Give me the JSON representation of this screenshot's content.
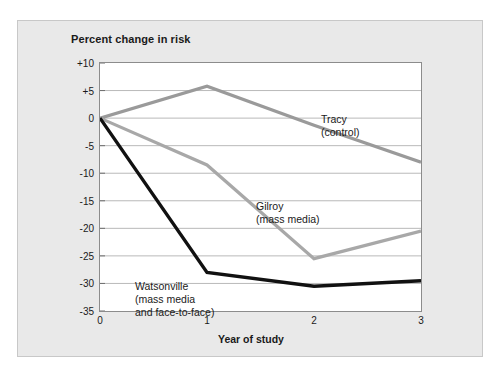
{
  "chart_data": {
    "type": "line",
    "title": "Percent change in risk",
    "xlabel": "Year of study",
    "ylabel": "",
    "x": [
      0,
      1,
      2,
      3
    ],
    "xtick_labels": [
      "0",
      "1",
      "2",
      "3"
    ],
    "ytick_labels": [
      "+10",
      "+5",
      "0",
      "-5",
      "-10",
      "-15",
      "-20",
      "-25",
      "-30",
      "-35"
    ],
    "ytick_values": [
      10,
      5,
      0,
      -5,
      -10,
      -15,
      -20,
      -25,
      -30,
      -35
    ],
    "xlim": [
      0,
      3
    ],
    "ylim": [
      -35,
      10
    ],
    "grid": true,
    "legend_position": "inline-annotations",
    "series": [
      {
        "name": "Tracy (control)",
        "label_lines": [
          "Tracy",
          "(control)"
        ],
        "color": "#9a9a9a",
        "values": [
          0,
          5.8,
          -1.3,
          -8.0
        ]
      },
      {
        "name": "Gilroy (mass media)",
        "label_lines": [
          "Gilroy",
          "(mass media)"
        ],
        "color": "#a8a8a8",
        "values": [
          0,
          -8.5,
          -25.5,
          -20.5
        ]
      },
      {
        "name": "Watsonville (mass media and face-to-face)",
        "label_lines": [
          "Watsonville",
          "(mass media",
          "and face-to-face)"
        ],
        "color": "#111111",
        "values": [
          0,
          -28.0,
          -30.5,
          -29.5
        ]
      }
    ]
  },
  "labels": {
    "tracy_line1": "Tracy",
    "tracy_line2": "(control)",
    "gilroy_line1": "Gilroy",
    "gilroy_line2": "(mass media)",
    "watsonville_line1": "Watsonville",
    "watsonville_line2": "(mass media",
    "watsonville_line3": "and face-to-face)"
  },
  "ytick": {
    "t0": "+10",
    "t1": "+5",
    "t2": "0",
    "t3": "-5",
    "t4": "-10",
    "t5": "-15",
    "t6": "-20",
    "t7": "-25",
    "t8": "-30",
    "t9": "-35"
  },
  "xtick": {
    "t0": "0",
    "t1": "1",
    "t2": "2",
    "t3": "3"
  }
}
